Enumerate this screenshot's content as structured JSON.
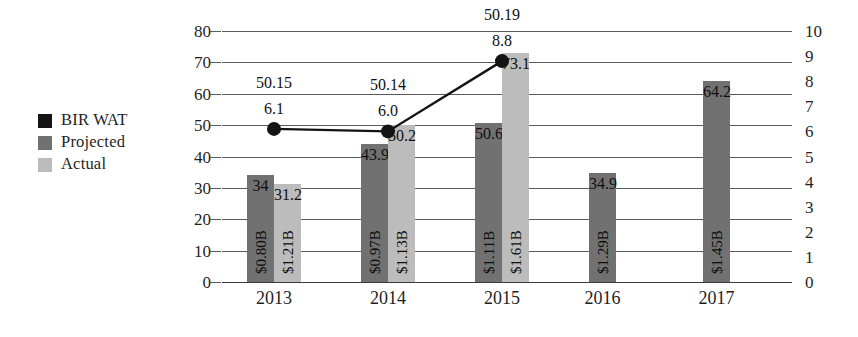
{
  "legend": {
    "items": [
      {
        "label": "BIR WAT",
        "color": "#141414",
        "name": "legend-item-bir-wat"
      },
      {
        "label": "Projected",
        "color": "#717171",
        "name": "legend-item-projected"
      },
      {
        "label": "Actual",
        "color": "#bcbcbc",
        "name": "legend-item-actual"
      }
    ]
  },
  "chart_data": {
    "type": "bar",
    "title": "",
    "subtitle": "",
    "xlabel": "",
    "ylabel": "",
    "grid": true,
    "legend_position": "left",
    "categories": [
      "2013",
      "2014",
      "2015",
      "2016",
      "2017"
    ],
    "left_axis": {
      "ticks": [
        "0",
        "10",
        "20",
        "30",
        "40",
        "50",
        "60",
        "70",
        "80"
      ],
      "min": 0,
      "max": 80,
      "step": 10
    },
    "right_axis": {
      "ticks": [
        "0",
        "1",
        "2",
        "3",
        "4",
        "5",
        "6",
        "7",
        "8",
        "9",
        "10"
      ],
      "min": 0,
      "max": 10,
      "step": 1
    },
    "series": [
      {
        "name": "Projected",
        "type": "bar",
        "axis": "left",
        "color": "#717171",
        "values": [
          34,
          43.9,
          50.6,
          34.9,
          64.2
        ],
        "value_labels": [
          "34",
          "43.9",
          "50.6",
          "34.9",
          "64.2"
        ],
        "inner_labels": [
          "$0.80B",
          "$0.97B",
          "$1.11B",
          "$1.29B",
          "$1.45B"
        ]
      },
      {
        "name": "Actual",
        "type": "bar",
        "axis": "left",
        "color": "#bcbcbc",
        "values": [
          31.2,
          50.2,
          73.1,
          null,
          null
        ],
        "value_labels": [
          "31.2",
          "50.2",
          "73.1",
          "",
          ""
        ],
        "inner_labels": [
          "$1.21B",
          "$1.13B",
          "$1.61B",
          "",
          ""
        ]
      },
      {
        "name": "BIR WAT",
        "type": "line",
        "axis": "right",
        "color": "#141414",
        "x": [
          "2013",
          "2014",
          "2015"
        ],
        "values": [
          6.1,
          6.0,
          8.8
        ],
        "point_labels": [
          "6.1",
          "6.0",
          "8.8"
        ],
        "top_labels": [
          "50.15",
          "50.14",
          "50.19"
        ]
      }
    ]
  }
}
